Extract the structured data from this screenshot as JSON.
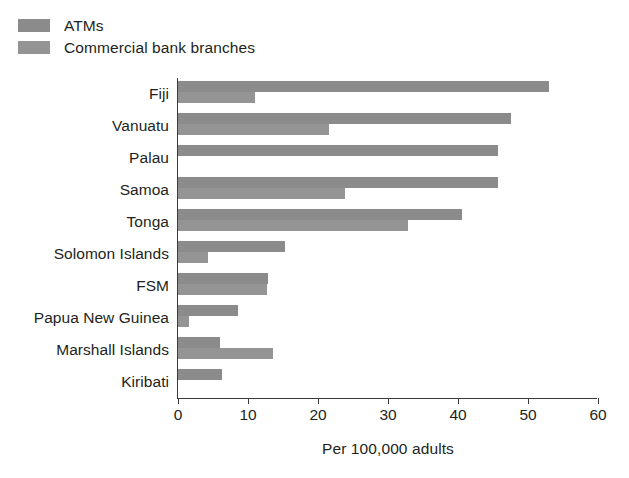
{
  "chart_data": {
    "type": "bar",
    "orientation": "horizontal",
    "title": "",
    "xlabel": "Per 100,000 adults",
    "ylabel": "",
    "xlim": [
      0,
      60
    ],
    "xticks": [
      0,
      10,
      20,
      30,
      40,
      50,
      60
    ],
    "xtick_labels": [
      "0",
      "10",
      "20",
      "30",
      "40",
      "50",
      "60"
    ],
    "grid": false,
    "legend_position": "above-plot-left",
    "categories": [
      "Fiji",
      "Vanuatu",
      "Palau",
      "Samoa",
      "Tonga",
      "Solomon Islands",
      "FSM",
      "Papua New Guinea",
      "Marshall Islands",
      "Kiribati"
    ],
    "series": [
      {
        "name": "ATMs",
        "color": "#8b8b8b",
        "values": [
          53.0,
          47.6,
          45.7,
          45.7,
          40.6,
          15.3,
          12.9,
          8.6,
          6.0,
          6.3
        ]
      },
      {
        "name": "Commercial bank branches",
        "color": "#949494",
        "values": [
          11.0,
          21.5,
          0,
          23.9,
          32.9,
          4.3,
          12.7,
          1.5,
          13.6,
          0
        ]
      }
    ]
  },
  "legend": {
    "items": [
      {
        "label": "ATMs",
        "color": "#8b8b8b"
      },
      {
        "label": "Commercial bank branches",
        "color": "#949494"
      }
    ]
  },
  "axis": {
    "x_title": "Per 100,000 adults"
  }
}
